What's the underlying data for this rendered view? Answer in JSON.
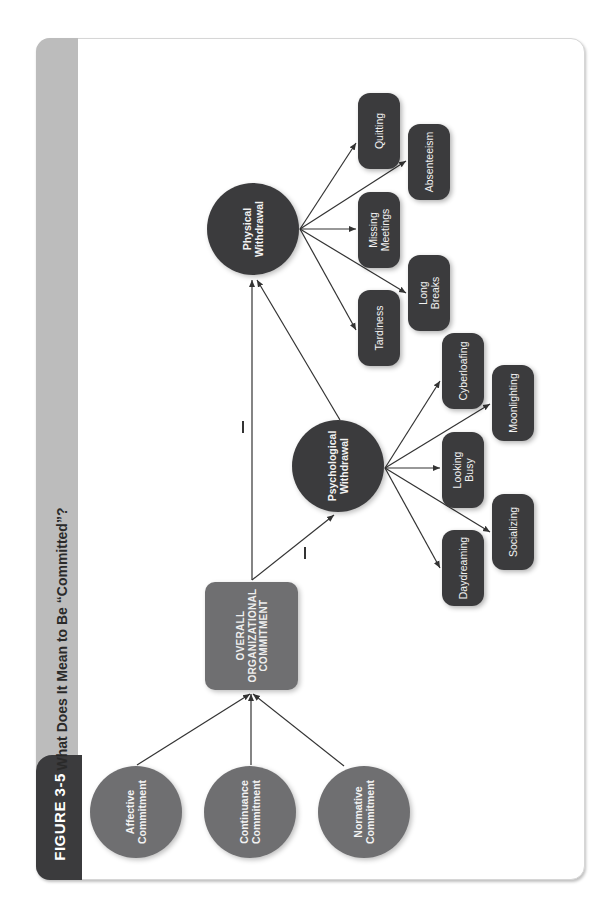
{
  "figure": {
    "label": "FIGURE 3-5",
    "title": "What Does It Mean to Be “Committed”?"
  },
  "colors": {
    "strip": "#bcbcbc",
    "tab": "#3b3b3d",
    "commitment_nodes": "#6f6f71",
    "withdrawal_nodes": "#3b3b3d",
    "lines": "#333333"
  },
  "diagram": {
    "commitment_types": [
      {
        "label": "Affective\nCommitment"
      },
      {
        "label": "Continuance\nCommitment"
      },
      {
        "label": "Normative\nCommitment"
      }
    ],
    "overall": {
      "label": "OVERALL\nORGANIZATIONAL\nCOMMITMENT"
    },
    "psychological": {
      "label": "Psychological\nWithdrawal",
      "relation_sign": "−",
      "behaviors": [
        {
          "label": "Daydreaming"
        },
        {
          "label": "Socializing"
        },
        {
          "label": "Looking\nBusy"
        },
        {
          "label": "Moonlighting"
        },
        {
          "label": "Cyberloafing"
        }
      ]
    },
    "physical": {
      "label": "Physical\nWithdrawal",
      "relation_sign": "−",
      "behaviors": [
        {
          "label": "Tardiness"
        },
        {
          "label": "Long\nBreaks"
        },
        {
          "label": "Missing\nMeetings"
        },
        {
          "label": "Absenteeism"
        },
        {
          "label": "Quitting"
        }
      ]
    }
  }
}
